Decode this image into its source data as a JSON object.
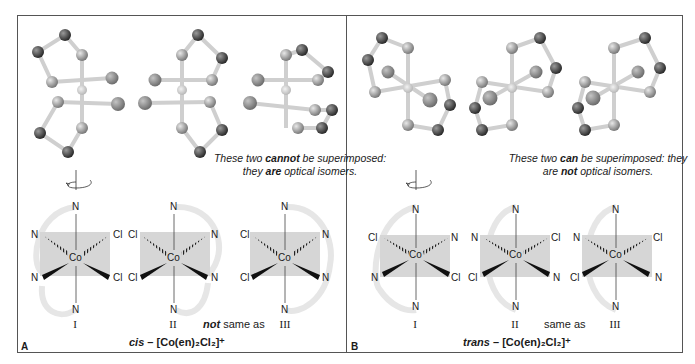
{
  "panels": [
    {
      "label": "A",
      "note": {
        "pre": "These two ",
        "bold1": "cannot",
        "mid1": " be superimposed: they ",
        "bold2": "are",
        "post": " optical isomers."
      },
      "numerals": [
        "I",
        "II",
        "III"
      ],
      "relation": {
        "bold": "not",
        "text": " same as"
      },
      "caption": {
        "italic": "cis",
        "formula": " – [Co(en)₂Cl₂]⁺"
      },
      "structures": [
        {
          "top": "N",
          "bottom": "N",
          "upper_left": "N",
          "upper_right": "Cl",
          "lower_left": "N",
          "lower_right": "Cl",
          "center": "Co"
        },
        {
          "top": "N",
          "bottom": "N",
          "upper_left": "Cl",
          "upper_right": "N",
          "lower_left": "Cl",
          "lower_right": "N",
          "center": "Co"
        },
        {
          "top": "N",
          "bottom": "N",
          "upper_left": "Cl",
          "upper_right": "N",
          "lower_left": "Cl",
          "lower_right": "N",
          "center": "Co"
        }
      ]
    },
    {
      "label": "B",
      "note": {
        "pre": "These two ",
        "bold1": "can",
        "mid1": " be superimposed: they are ",
        "bold2": "not",
        "post": " optical isomers."
      },
      "numerals": [
        "I",
        "II",
        "III"
      ],
      "relation": {
        "bold": "",
        "text": "same as"
      },
      "caption": {
        "italic": "trans",
        "formula": " – [Co(en)₂Cl₂]⁺"
      },
      "structures": [
        {
          "top": "N",
          "bottom": "N",
          "upper_left": "Cl",
          "upper_right": "N",
          "lower_left": "N",
          "lower_right": "Cl",
          "center": "Co"
        },
        {
          "top": "N",
          "bottom": "N",
          "upper_left": "N",
          "upper_right": "Cl",
          "lower_left": "Cl",
          "lower_right": "N",
          "center": "Co"
        },
        {
          "top": "N",
          "bottom": "N",
          "upper_left": "N",
          "upper_right": "Cl",
          "lower_left": "Cl",
          "lower_right": "N",
          "center": "Co"
        }
      ]
    }
  ],
  "colors": {
    "plane": "#d4d4d4",
    "ring": "#e6e6e6",
    "atom_n": "#8a8a8a",
    "atom_c": "#4a4a4a",
    "atom_cl": "#8f8f8f",
    "bond": "#cfcfcf"
  }
}
